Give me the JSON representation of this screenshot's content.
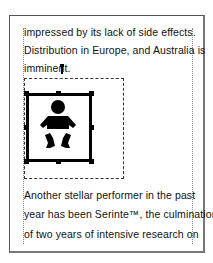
{
  "document": {
    "paragraph1": {
      "lines": [
        "impressed by its lack of side effects.",
        "Distribution in Europe, and Australia is",
        "imminent."
      ]
    },
    "image": {
      "icon": "baby-icon",
      "selected": true,
      "frame_color": "#000000"
    },
    "paragraph2": {
      "lines": [
        "Another stellar performer in the past",
        "year has been Serinte™, the culmination",
        "of two years of intensive research on"
      ]
    }
  }
}
